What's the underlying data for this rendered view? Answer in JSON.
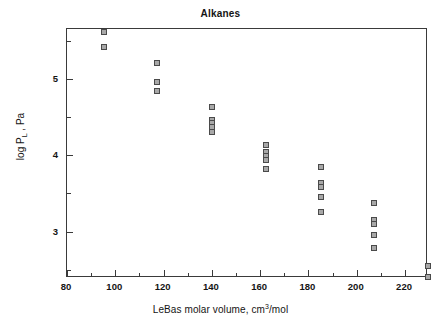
{
  "chart_data": {
    "type": "scatter",
    "title": "Alkanes",
    "xlabel": "LeBas molar volume, cm3/mol",
    "xlabel_parts": {
      "pre": "LeBas molar volume, cm",
      "sup": "3",
      "post": "/mol"
    },
    "ylabel": "log PL , Pa",
    "ylabel_parts": {
      "pre": "log P",
      "sub": "L",
      "post": " , Pa"
    },
    "xlim": [
      80,
      229.5
    ],
    "ylim": [
      2.39,
      5.66
    ],
    "grid": false,
    "legend": null,
    "xticks_major": [
      80,
      100,
      120,
      140,
      160,
      180,
      200,
      220
    ],
    "xticks_minor": [
      90,
      110,
      130,
      150,
      170,
      190,
      210
    ],
    "yticks_major": [
      5,
      4,
      3
    ],
    "yticks_minor": [
      5.5,
      4.5,
      3.5,
      2.5
    ],
    "xtick_labels": [
      "80",
      "100",
      "120",
      "140",
      "160",
      "180",
      "200",
      "220"
    ],
    "ytick_labels": [
      "5",
      "4",
      "3"
    ],
    "marker": "square",
    "marker_fill": "#a8a8a8",
    "marker_edge": "#4a4a4a",
    "series": [
      {
        "name": "Alkanes",
        "points": [
          {
            "x": 95.2,
            "y": 5.62
          },
          {
            "x": 95.2,
            "y": 5.43
          },
          {
            "x": 117.4,
            "y": 5.22
          },
          {
            "x": 117.4,
            "y": 4.97
          },
          {
            "x": 117.4,
            "y": 4.84
          },
          {
            "x": 140.0,
            "y": 4.63
          },
          {
            "x": 140.0,
            "y": 4.47
          },
          {
            "x": 140.0,
            "y": 4.42
          },
          {
            "x": 140.0,
            "y": 4.37
          },
          {
            "x": 140.0,
            "y": 4.31
          },
          {
            "x": 162.4,
            "y": 4.14
          },
          {
            "x": 162.4,
            "y": 4.05
          },
          {
            "x": 162.4,
            "y": 3.99
          },
          {
            "x": 162.4,
            "y": 3.94
          },
          {
            "x": 162.4,
            "y": 3.82
          },
          {
            "x": 185.0,
            "y": 3.85
          },
          {
            "x": 185.0,
            "y": 3.64
          },
          {
            "x": 185.0,
            "y": 3.59
          },
          {
            "x": 185.0,
            "y": 3.46
          },
          {
            "x": 185.0,
            "y": 3.26
          },
          {
            "x": 207.2,
            "y": 3.38
          },
          {
            "x": 207.2,
            "y": 3.15
          },
          {
            "x": 207.2,
            "y": 3.1
          },
          {
            "x": 207.2,
            "y": 2.95
          },
          {
            "x": 207.2,
            "y": 2.78
          },
          {
            "x": 229.4,
            "y": 2.55
          },
          {
            "x": 229.4,
            "y": 2.4
          }
        ]
      }
    ]
  }
}
